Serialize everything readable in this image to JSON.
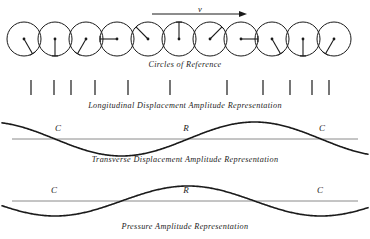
{
  "figure": {
    "background_color": "#ffffff",
    "ink_color": "#1a1a1a",
    "axis_color": "#8a8a8a",
    "width": 370,
    "height": 239
  },
  "velocity_arrow": {
    "label": "v",
    "label_x": 200,
    "label_y": 7,
    "line_x1": 152,
    "line_x2": 247,
    "line_y": 14
  },
  "captions": {
    "circles": "Circles of Reference",
    "longitudinal": "Longitudinal  Displacement  Amplitude  Representation",
    "transverse": "Transverse  Displacement  Amplitude  Representation",
    "pressure": "Pressure  Amplitude  Representation"
  },
  "circles_of_reference": {
    "count": 11,
    "radius": 17,
    "center_y": 39,
    "centers_x": [
      24,
      55,
      86,
      117,
      148,
      179,
      210,
      241,
      272,
      303,
      334
    ],
    "phase_labels": [
      "down-right",
      "down",
      "down-left",
      "left",
      "up-left",
      "up",
      "up-right",
      "right",
      "down-right",
      "down",
      "down-left"
    ],
    "phase_degrees": [
      60,
      90,
      120,
      180,
      225,
      270,
      315,
      0,
      60,
      90,
      120
    ]
  },
  "longitudinal": {
    "tick_y_top": 80,
    "tick_y_bottom": 95,
    "tick_positions_x": [
      31,
      54,
      71,
      95,
      128,
      170,
      227,
      263,
      290,
      312,
      329
    ]
  },
  "transverse_wave": {
    "axis_y": 139,
    "axis_x1": 12,
    "axis_x2": 358,
    "amplitude": 17,
    "wavelength": 266,
    "phase_offset_x": 55,
    "markers": [
      {
        "label": "C",
        "x": 58,
        "y": 131
      },
      {
        "label": "R",
        "x": 186,
        "y": 131
      },
      {
        "label": "C",
        "x": 322,
        "y": 131
      }
    ]
  },
  "pressure_wave": {
    "axis_y": 201,
    "axis_x1": 12,
    "axis_x2": 358,
    "amplitude": 15,
    "wavelength": 266,
    "phase_offset_x": 55,
    "markers": [
      {
        "label": "C",
        "x": 54,
        "y": 193
      },
      {
        "label": "R",
        "x": 186,
        "y": 193
      },
      {
        "label": "C",
        "x": 320,
        "y": 193
      }
    ]
  },
  "chart_data": {
    "type": "line",
    "xlabel": "",
    "ylabel": "",
    "series": [
      {
        "name": "Transverse Displacement Amplitude",
        "form": "sine",
        "amplitude": 17,
        "wavelength": 266,
        "phase_zero_crossings_x": [
          55,
          188,
          321
        ],
        "peak_x": [
          255
        ],
        "trough_x": [
          122
        ],
        "baseline_y": 139
      },
      {
        "name": "Pressure Amplitude",
        "form": "cosine",
        "amplitude": 15,
        "wavelength": 266,
        "phase_zero_crossings_x": [
          122,
          255
        ],
        "peak_x": [
          55,
          321
        ],
        "trough_x": [
          188
        ],
        "baseline_y": 201
      },
      {
        "name": "Longitudinal Displacement (particle tick marks)",
        "form": "discrete",
        "values": [
          31,
          54,
          71,
          95,
          128,
          170,
          227,
          263,
          290,
          312,
          329
        ]
      }
    ],
    "annotations": [
      {
        "text": "C",
        "meaning": "compression",
        "x": 58
      },
      {
        "text": "R",
        "meaning": "rarefaction",
        "x": 186
      },
      {
        "text": "C",
        "meaning": "compression",
        "x": 322
      },
      {
        "text": "v",
        "meaning": "wave velocity direction",
        "x": 200
      }
    ],
    "grid": false,
    "legend": "none"
  }
}
